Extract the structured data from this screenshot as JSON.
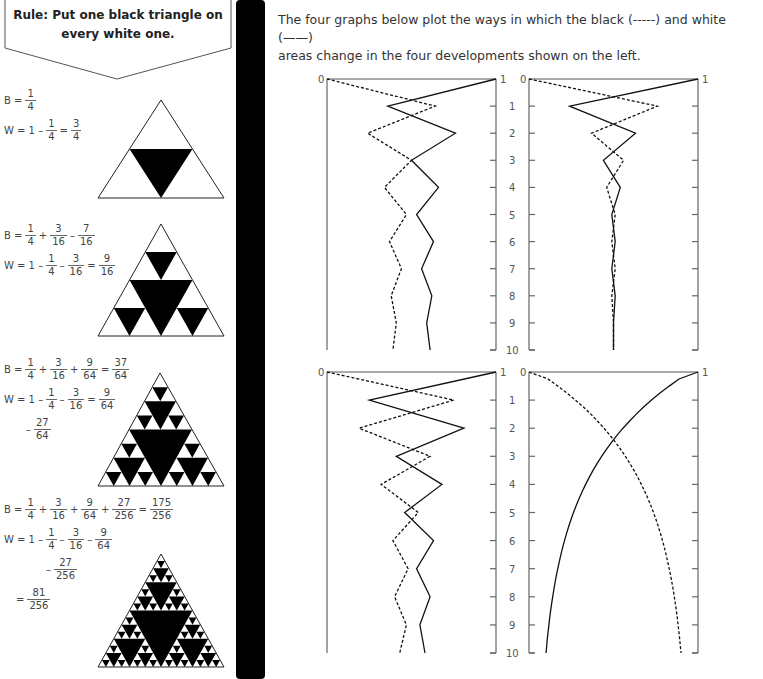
{
  "rule": {
    "line1": "Rule: Put one black triangle on",
    "line2": "every white one."
  },
  "intro": {
    "line1": "The four graphs below plot the ways in which the black (-----) and white (——)",
    "line2": "areas change in the four developments shown on the left."
  },
  "steps": [
    {
      "b": {
        "prefix": "B =",
        "terms": [
          [
            "1",
            "4"
          ]
        ],
        "result": null
      },
      "w": {
        "prefix": "W = 1 –",
        "terms": [
          [
            "1",
            "4"
          ]
        ],
        "result": [
          "3",
          "4"
        ]
      },
      "w_extra": null,
      "w_final": null
    },
    {
      "b": {
        "prefix": "B =",
        "terms": [
          [
            "1",
            "4"
          ],
          [
            "3",
            "16"
          ]
        ],
        "result": [
          "7",
          "16"
        ]
      },
      "w": {
        "prefix": "W = 1 –",
        "terms": [
          [
            "1",
            "4"
          ],
          [
            "3",
            "16"
          ]
        ],
        "result": [
          "9",
          "16"
        ]
      },
      "w_extra": null,
      "w_final": null
    },
    {
      "b": {
        "prefix": "B =",
        "terms": [
          [
            "1",
            "4"
          ],
          [
            "3",
            "16"
          ],
          [
            "9",
            "64"
          ]
        ],
        "result": [
          "37",
          "64"
        ]
      },
      "w": {
        "prefix": "W = 1 –",
        "terms": [
          [
            "1",
            "4"
          ],
          [
            "3",
            "16"
          ]
        ],
        "result": [
          "9",
          "64"
        ]
      },
      "w_extra": [
        "27",
        "64"
      ],
      "w_final": null
    },
    {
      "b": {
        "prefix": "B =",
        "terms": [
          [
            "1",
            "4"
          ],
          [
            "3",
            "16"
          ],
          [
            "9",
            "64"
          ],
          [
            "27",
            "256"
          ]
        ],
        "result": [
          "175",
          "256"
        ]
      },
      "w": {
        "prefix": "W = 1 –",
        "terms": [
          [
            "1",
            "4"
          ],
          [
            "3",
            "16"
          ],
          [
            "9",
            "64"
          ]
        ],
        "result": null
      },
      "w_extra": [
        "27",
        "256"
      ],
      "w_final": [
        "81",
        "256"
      ]
    }
  ],
  "chart_data": [
    {
      "type": "line",
      "title": "",
      "position": "top-left",
      "x_axis": {
        "label_left": "0",
        "label_right": "1",
        "range": [
          0,
          1
        ]
      },
      "y_axis": {
        "ticks": [
          "1",
          "2",
          "3",
          "4",
          "5",
          "6",
          "7",
          "8",
          "9",
          "10"
        ],
        "range": [
          0,
          10
        ],
        "inverted": true
      },
      "series": [
        {
          "name": "black",
          "style": "dashed",
          "values": [
            0,
            0.64,
            0.24,
            0.5,
            0.34,
            0.47,
            0.37,
            0.44,
            0.38,
            0.41,
            0.39
          ]
        },
        {
          "name": "white",
          "style": "solid",
          "values": [
            1,
            0.36,
            0.76,
            0.5,
            0.66,
            0.53,
            0.63,
            0.56,
            0.62,
            0.59,
            0.61
          ]
        }
      ]
    },
    {
      "type": "line",
      "title": "",
      "position": "top-right",
      "x_axis": {
        "label_left": "0",
        "label_right": "1",
        "range": [
          0,
          1
        ]
      },
      "y_axis": {
        "ticks": [
          "1",
          "2",
          "3",
          "4",
          "5",
          "6",
          "7",
          "8",
          "9",
          "10"
        ],
        "range": [
          0,
          10
        ],
        "inverted": true
      },
      "series": [
        {
          "name": "black",
          "style": "dashed",
          "values": [
            0,
            0.76,
            0.37,
            0.56,
            0.46,
            0.51,
            0.49,
            0.51,
            0.49,
            0.5,
            0.5
          ]
        },
        {
          "name": "white",
          "style": "solid",
          "values": [
            1,
            0.24,
            0.63,
            0.44,
            0.54,
            0.49,
            0.51,
            0.49,
            0.51,
            0.5,
            0.5
          ]
        }
      ]
    },
    {
      "type": "line",
      "title": "",
      "position": "bottom-left",
      "x_axis": {
        "label_left": "0",
        "label_right": "1",
        "range": [
          0,
          1
        ]
      },
      "y_axis": {
        "ticks": [
          "1",
          "2",
          "3",
          "4",
          "5",
          "6",
          "7",
          "8",
          "9",
          "10"
        ],
        "range": [
          0,
          10
        ],
        "inverted": true
      },
      "series": [
        {
          "name": "black",
          "style": "dashed",
          "values": [
            0,
            0.75,
            0.19,
            0.61,
            0.32,
            0.54,
            0.39,
            0.48,
            0.4,
            0.47,
            0.43
          ]
        },
        {
          "name": "white",
          "style": "solid",
          "values": [
            1,
            0.25,
            0.81,
            0.41,
            0.68,
            0.46,
            0.63,
            0.53,
            0.61,
            0.55,
            0.58
          ]
        }
      ]
    },
    {
      "type": "line",
      "title": "",
      "position": "bottom-right",
      "x_axis": {
        "label_left": "0",
        "label_right": "1",
        "range": [
          0,
          1
        ]
      },
      "y_axis": {
        "ticks": [
          "1",
          "2",
          "3",
          "4",
          "5",
          "6",
          "7",
          "8",
          "9",
          "10"
        ],
        "range": [
          0,
          10
        ],
        "inverted": true
      },
      "series": [
        {
          "name": "black",
          "style": "dashed",
          "values": [
            0,
            0.25,
            0.44,
            0.58,
            0.68,
            0.76,
            0.82,
            0.87,
            0.9,
            0.93,
            0.95
          ]
        },
        {
          "name": "white",
          "style": "solid",
          "values": [
            1,
            0.75,
            0.56,
            0.42,
            0.32,
            0.24,
            0.18,
            0.13,
            0.1,
            0.07,
            0.05
          ]
        }
      ]
    }
  ]
}
